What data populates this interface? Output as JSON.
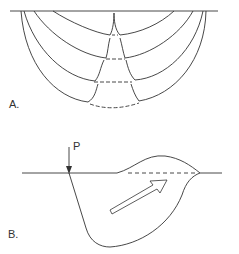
{
  "figure": {
    "panel_a": {
      "label": "A.",
      "description": "Nested cusped failure surfaces beneath a horizontal ground surface, with dashed connections at the base"
    },
    "panel_b": {
      "label": "B.",
      "load_label": "P",
      "description": "Loaded point P on surface with displaced soil wedge bulging above surface; hollow arrow shows upward flow direction"
    },
    "colors": {
      "line": "#333333",
      "background": "#ffffff"
    }
  }
}
